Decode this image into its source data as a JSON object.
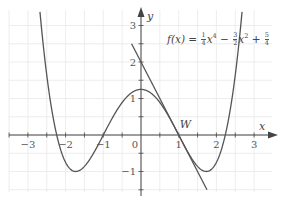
{
  "chart_data": {
    "type": "line",
    "title": "",
    "function_label": "f(x) = 1/4 x^4 − 3/2 x^2 + 5/4",
    "formula_parts": {
      "lhs": "f(x) = ",
      "t1_num": "1",
      "t1_den": "4",
      "t1_var": "x",
      "t1_exp": "4",
      "op1": " − ",
      "t2_num": "3",
      "t2_den": "2",
      "t2_var": "x",
      "t2_exp": "2",
      "op2": " + ",
      "t3_num": "5",
      "t3_den": "4"
    },
    "xlabel": "x",
    "ylabel": "y",
    "xlim": [
      -3.5,
      3.5
    ],
    "ylim": [
      -1.5,
      3.4
    ],
    "x_ticks": [
      "−3",
      "−2",
      "−1",
      "0",
      "1",
      "2",
      "3"
    ],
    "y_ticks": [
      "3",
      "2",
      "1",
      "−1"
    ],
    "grid": true,
    "grid_step": 0.5,
    "series": [
      {
        "name": "f(x)",
        "expression": "0.25*x^4 - 1.5*x^2 + 1.25",
        "x_range": [
          -2.68,
          2.68
        ],
        "key_points": [
          {
            "x": -2.236,
            "y": 0
          },
          {
            "x": -1.732,
            "y": -1
          },
          {
            "x": -1,
            "y": 0
          },
          {
            "x": 0,
            "y": 1.25
          },
          {
            "x": 1,
            "y": 0
          },
          {
            "x": 1.732,
            "y": -1
          },
          {
            "x": 2.236,
            "y": 0
          }
        ]
      },
      {
        "name": "tangent at W",
        "expression": "-2*x + 2",
        "x_range": [
          -0.25,
          1.75
        ]
      }
    ],
    "annotations": [
      {
        "label": "W",
        "x": 1,
        "y": 0
      }
    ]
  },
  "labels": {
    "x_axis": "x",
    "y_axis": "y",
    "origin": "0",
    "point_w": "W",
    "x_ticks": [
      "−3",
      "−2",
      "−1",
      "1",
      "2",
      "3"
    ],
    "y_ticks": [
      "3",
      "2",
      "1",
      "−1"
    ]
  },
  "colors": {
    "curve": "#555555",
    "grid": "#e6e6e6",
    "axis": "#444444"
  }
}
